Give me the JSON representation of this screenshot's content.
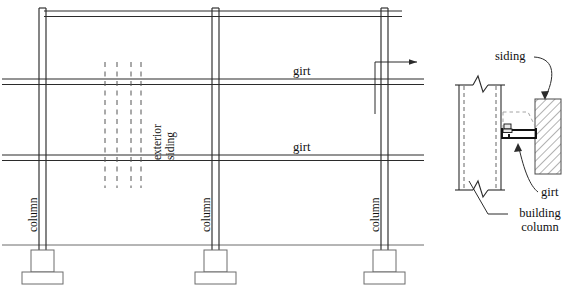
{
  "figure": {
    "stroke_color": "#2b2b2b",
    "hatch_color": "#4a4a4a",
    "dashed_color": "#555555",
    "background": "#ffffff"
  },
  "elevation": {
    "labels": {
      "girt_upper": "girt",
      "girt_lower": "girt",
      "exterior_siding_line1": "exterior",
      "exterior_siding_line2": "siding",
      "column_left": "column",
      "column_middle": "column",
      "column_right": "column"
    },
    "components": {
      "roof_beam": "roof-beam",
      "ground_line": "ground-line",
      "footing": "footing",
      "pier": "pier",
      "section_marker": "section-cut-arrow"
    }
  },
  "detail": {
    "labels": {
      "siding": "siding",
      "girt": "girt",
      "building_column_line1": "building",
      "building_column_line2": "column"
    },
    "components": {
      "column_section": "column-section",
      "break_symbol_top": "break-symbol",
      "break_symbol_bottom": "break-symbol",
      "girt_section": "girt-c-section",
      "bolt": "bolt-fastener",
      "siding_hatch": "siding-hatch"
    }
  }
}
